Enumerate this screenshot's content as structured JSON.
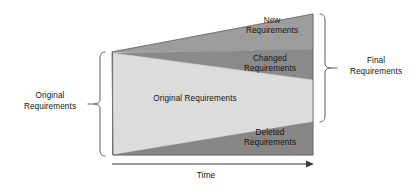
{
  "figure": {
    "bands": [
      {
        "id": "new",
        "label": "New\nRequirements",
        "color": "#9d9d9d",
        "position": "top-wedge"
      },
      {
        "id": "changed",
        "label": "Changed\nRequirements",
        "color": "#8a8a8a",
        "position": "upper-middle-wedge"
      },
      {
        "id": "original",
        "label": "Original Requirements",
        "color": "#dcdcdc",
        "position": "center-wedge"
      },
      {
        "id": "deleted",
        "label": "Deleted\nRequirements",
        "color": "#868686",
        "position": "bottom-wedge"
      }
    ],
    "brace_left": {
      "label": "Original\nRequirements",
      "color": "#555555"
    },
    "brace_right": {
      "label": "Final\nRequirements",
      "color": "#555555"
    },
    "axis": {
      "label": "Time",
      "direction": "left-to-right",
      "color": "#3a3a3a"
    },
    "colors": {
      "background": "#ffffff",
      "outline": "#707070",
      "text": "#141414"
    }
  }
}
